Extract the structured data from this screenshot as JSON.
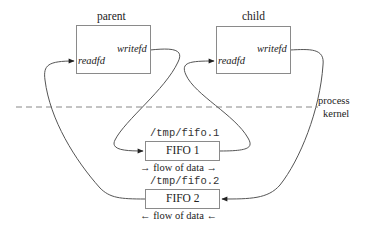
{
  "diagram": {
    "type": "ipc-fifo-client-server",
    "boundary": {
      "upper_label": "process",
      "lower_label": "kernel"
    },
    "processes": [
      {
        "id": "parent",
        "title": "parent",
        "read_label": "readfd",
        "write_label": "writefd"
      },
      {
        "id": "child",
        "title": "child",
        "read_label": "readfd",
        "write_label": "writefd"
      }
    ],
    "fifos": [
      {
        "id": "fifo1",
        "path": "/tmp/fifo.1",
        "label": "FIFO 1",
        "flow": "→ flow of data →"
      },
      {
        "id": "fifo2",
        "path": "/tmp/fifo.2",
        "label": "FIFO 2",
        "flow": "← flow of data ←"
      }
    ],
    "connections": [
      {
        "from": "parent.writefd",
        "to": "fifo1"
      },
      {
        "from": "fifo1",
        "to": "child.readfd"
      },
      {
        "from": "child.writefd",
        "to": "fifo2"
      },
      {
        "from": "fifo2",
        "to": "parent.readfd"
      }
    ],
    "colors": {
      "line": "#555555",
      "box_border": "#8a8a8a",
      "dashed": "#888888",
      "text": "#222222"
    }
  }
}
